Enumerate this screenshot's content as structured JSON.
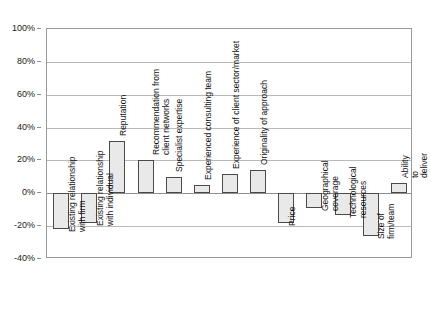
{
  "chart_data": {
    "type": "bar",
    "title": "",
    "subtitle": "",
    "xlabel": "",
    "ylabel": "",
    "ylim": [
      -40,
      100
    ],
    "ytick_labels": [
      "100%",
      "80%",
      "60%",
      "40%",
      "20%",
      "0%",
      "-20%",
      "-40%"
    ],
    "ytick_values": [
      100,
      80,
      60,
      40,
      20,
      0,
      -20,
      -40
    ],
    "grid": true,
    "legend": "none",
    "orientation": "vertical",
    "categories": [
      "Existing relationship\nwith firm",
      "Existing relationship\nwith individual",
      "Reputation",
      "Recommendation from\nclient networks",
      "Specialist expertise",
      "Experienced consulting team",
      "Experience of client sector/market",
      "Originality of approach",
      "Price",
      "Geographical\ncoverage",
      "Technological\nresources",
      "Size of\nfirm/team",
      "Ability to deliver"
    ],
    "values": [
      -22,
      -18,
      32,
      20,
      10,
      5,
      12,
      14,
      -18,
      -9,
      -13,
      -26,
      6
    ],
    "bar_fill_color": "#e9e9e9",
    "bar_border_color": "#4a4a4a",
    "gridline_color": "#b9b9b9",
    "axis_color": "#9a9a9a"
  }
}
